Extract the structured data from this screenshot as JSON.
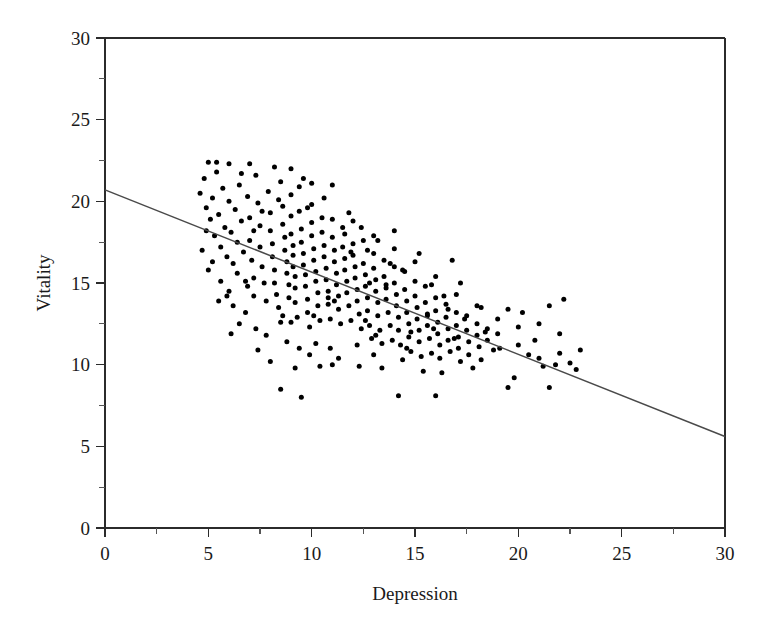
{
  "chart_data": {
    "type": "scatter",
    "title": "",
    "xlabel": "Depression",
    "ylabel": "Vitality",
    "xlim": [
      0,
      30
    ],
    "ylim": [
      0,
      30
    ],
    "xticks": [
      0,
      5,
      10,
      15,
      20,
      25,
      30
    ],
    "yticks": [
      0,
      5,
      10,
      15,
      20,
      25,
      30
    ],
    "xtick_labels": [
      "0",
      "5",
      "10",
      "15",
      "20",
      "25",
      "30"
    ],
    "ytick_labels": [
      "0",
      "5",
      "10",
      "15",
      "20",
      "25",
      "30"
    ],
    "minor_tick_step": 2.5,
    "grid": false,
    "legend": null,
    "marker": {
      "shape": "circle",
      "color": "#000000",
      "size_px": 5
    },
    "trendline": {
      "type": "linear",
      "color": "#4a4a4a",
      "x_start": 0,
      "y_start": 20.7,
      "x_end": 30,
      "y_end": 5.6,
      "slope": -0.503,
      "intercept": 20.7
    },
    "n_points": 330,
    "points": [
      [
        4.6,
        20.5
      ],
      [
        4.8,
        21.4
      ],
      [
        4.9,
        19.6
      ],
      [
        5.0,
        22.4
      ],
      [
        5.1,
        18.9
      ],
      [
        5.2,
        20.2
      ],
      [
        5.3,
        17.9
      ],
      [
        5.4,
        21.8
      ],
      [
        5.5,
        19.2
      ],
      [
        5.6,
        17.2
      ],
      [
        5.7,
        20.8
      ],
      [
        5.8,
        18.4
      ],
      [
        5.9,
        16.6
      ],
      [
        6.0,
        22.3
      ],
      [
        6.0,
        20.0
      ],
      [
        6.1,
        18.1
      ],
      [
        6.2,
        16.2
      ],
      [
        6.3,
        19.5
      ],
      [
        6.4,
        17.5
      ],
      [
        6.4,
        15.6
      ],
      [
        6.5,
        21.0
      ],
      [
        6.6,
        18.8
      ],
      [
        6.7,
        16.9
      ],
      [
        6.8,
        15.1
      ],
      [
        6.9,
        20.3
      ],
      [
        7.0,
        19.0
      ],
      [
        7.0,
        17.6
      ],
      [
        7.1,
        16.4
      ],
      [
        7.2,
        15.3
      ],
      [
        7.2,
        14.2
      ],
      [
        7.3,
        21.6
      ],
      [
        7.4,
        19.9
      ],
      [
        7.5,
        18.5
      ],
      [
        7.5,
        17.2
      ],
      [
        7.6,
        16.0
      ],
      [
        7.7,
        15.0
      ],
      [
        7.8,
        13.9
      ],
      [
        7.9,
        20.6
      ],
      [
        8.0,
        19.3
      ],
      [
        8.0,
        18.2
      ],
      [
        8.1,
        17.4
      ],
      [
        8.1,
        16.6
      ],
      [
        8.2,
        15.8
      ],
      [
        8.2,
        15.0
      ],
      [
        8.3,
        14.3
      ],
      [
        8.4,
        13.5
      ],
      [
        8.5,
        12.6
      ],
      [
        8.5,
        21.2
      ],
      [
        8.6,
        19.7
      ],
      [
        8.6,
        18.6
      ],
      [
        8.7,
        17.8
      ],
      [
        8.7,
        17.0
      ],
      [
        8.8,
        16.3
      ],
      [
        8.8,
        15.6
      ],
      [
        8.9,
        14.9
      ],
      [
        8.9,
        14.1
      ],
      [
        9.0,
        22.0
      ],
      [
        9.0,
        20.4
      ],
      [
        9.0,
        19.1
      ],
      [
        9.0,
        18.0
      ],
      [
        9.1,
        17.3
      ],
      [
        9.1,
        16.7
      ],
      [
        9.1,
        16.0
      ],
      [
        9.2,
        15.4
      ],
      [
        9.2,
        14.7
      ],
      [
        9.2,
        13.8
      ],
      [
        9.3,
        12.9
      ],
      [
        9.4,
        20.9
      ],
      [
        9.4,
        19.4
      ],
      [
        9.5,
        18.3
      ],
      [
        9.5,
        17.5
      ],
      [
        9.6,
        16.8
      ],
      [
        9.6,
        16.1
      ],
      [
        9.7,
        15.5
      ],
      [
        9.7,
        14.8
      ],
      [
        9.8,
        14.0
      ],
      [
        9.8,
        13.2
      ],
      [
        9.9,
        12.3
      ],
      [
        10.0,
        21.1
      ],
      [
        10.0,
        19.8
      ],
      [
        10.0,
        18.7
      ],
      [
        10.0,
        17.9
      ],
      [
        10.1,
        17.1
      ],
      [
        10.1,
        16.4
      ],
      [
        10.2,
        15.7
      ],
      [
        10.2,
        15.1
      ],
      [
        10.3,
        14.4
      ],
      [
        10.3,
        13.6
      ],
      [
        10.4,
        12.7
      ],
      [
        10.5,
        19.0
      ],
      [
        10.5,
        18.1
      ],
      [
        10.6,
        17.3
      ],
      [
        10.6,
        16.6
      ],
      [
        10.7,
        15.9
      ],
      [
        10.7,
        15.2
      ],
      [
        10.8,
        14.5
      ],
      [
        10.8,
        13.7
      ],
      [
        10.9,
        12.8
      ],
      [
        11.0,
        21.0
      ],
      [
        11.0,
        18.9
      ],
      [
        11.0,
        17.8
      ],
      [
        11.1,
        17.0
      ],
      [
        11.1,
        16.3
      ],
      [
        11.2,
        15.6
      ],
      [
        11.2,
        14.9
      ],
      [
        11.3,
        14.2
      ],
      [
        11.3,
        13.4
      ],
      [
        11.4,
        12.5
      ],
      [
        11.5,
        18.4
      ],
      [
        11.5,
        17.2
      ],
      [
        11.6,
        16.5
      ],
      [
        11.6,
        15.8
      ],
      [
        11.7,
        15.1
      ],
      [
        11.7,
        14.4
      ],
      [
        11.8,
        13.6
      ],
      [
        11.9,
        12.7
      ],
      [
        12.0,
        18.8
      ],
      [
        12.0,
        17.4
      ],
      [
        12.0,
        16.7
      ],
      [
        12.1,
        16.0
      ],
      [
        12.1,
        15.3
      ],
      [
        12.2,
        14.6
      ],
      [
        12.2,
        13.9
      ],
      [
        12.3,
        13.1
      ],
      [
        12.4,
        12.2
      ],
      [
        12.5,
        17.6
      ],
      [
        12.5,
        16.2
      ],
      [
        12.6,
        15.5
      ],
      [
        12.6,
        14.8
      ],
      [
        12.7,
        14.1
      ],
      [
        12.7,
        13.3
      ],
      [
        12.8,
        12.4
      ],
      [
        12.9,
        11.6
      ],
      [
        13.0,
        17.9
      ],
      [
        13.0,
        16.8
      ],
      [
        13.0,
        15.9
      ],
      [
        13.1,
        15.2
      ],
      [
        13.1,
        14.5
      ],
      [
        13.2,
        13.8
      ],
      [
        13.2,
        13.0
      ],
      [
        13.3,
        12.1
      ],
      [
        13.4,
        11.3
      ],
      [
        13.5,
        16.4
      ],
      [
        13.5,
        15.4
      ],
      [
        13.6,
        14.7
      ],
      [
        13.6,
        14.0
      ],
      [
        13.7,
        13.2
      ],
      [
        13.8,
        12.4
      ],
      [
        13.9,
        11.5
      ],
      [
        14.0,
        17.1
      ],
      [
        14.0,
        16.0
      ],
      [
        14.0,
        15.0
      ],
      [
        14.1,
        14.3
      ],
      [
        14.1,
        13.6
      ],
      [
        14.2,
        12.9
      ],
      [
        14.2,
        12.1
      ],
      [
        14.3,
        11.2
      ],
      [
        14.4,
        10.3
      ],
      [
        14.5,
        15.7
      ],
      [
        14.5,
        14.6
      ],
      [
        14.6,
        13.9
      ],
      [
        14.6,
        13.2
      ],
      [
        14.7,
        12.5
      ],
      [
        14.7,
        11.7
      ],
      [
        14.8,
        10.8
      ],
      [
        15.0,
        16.3
      ],
      [
        15.0,
        15.1
      ],
      [
        15.0,
        14.2
      ],
      [
        15.1,
        13.5
      ],
      [
        15.1,
        12.8
      ],
      [
        15.2,
        12.1
      ],
      [
        15.2,
        11.4
      ],
      [
        15.3,
        10.5
      ],
      [
        15.4,
        9.6
      ],
      [
        15.5,
        14.8
      ],
      [
        15.5,
        13.8
      ],
      [
        15.6,
        13.1
      ],
      [
        15.6,
        12.4
      ],
      [
        15.7,
        11.6
      ],
      [
        15.8,
        10.7
      ],
      [
        16.0,
        15.4
      ],
      [
        16.0,
        14.1
      ],
      [
        16.0,
        13.3
      ],
      [
        16.1,
        12.6
      ],
      [
        16.1,
        11.9
      ],
      [
        16.2,
        11.2
      ],
      [
        16.2,
        10.4
      ],
      [
        16.3,
        9.5
      ],
      [
        16.5,
        13.7
      ],
      [
        16.5,
        12.9
      ],
      [
        16.6,
        12.2
      ],
      [
        16.6,
        11.5
      ],
      [
        16.7,
        10.8
      ],
      [
        17.0,
        14.3
      ],
      [
        17.0,
        13.2
      ],
      [
        17.0,
        12.4
      ],
      [
        17.1,
        11.7
      ],
      [
        17.1,
        11.0
      ],
      [
        17.2,
        10.2
      ],
      [
        17.5,
        13.0
      ],
      [
        17.5,
        12.1
      ],
      [
        17.6,
        11.4
      ],
      [
        17.6,
        10.6
      ],
      [
        18.0,
        13.6
      ],
      [
        18.0,
        12.5
      ],
      [
        18.0,
        11.8
      ],
      [
        18.1,
        11.1
      ],
      [
        18.2,
        10.3
      ],
      [
        18.5,
        12.2
      ],
      [
        18.5,
        11.5
      ],
      [
        19.0,
        12.8
      ],
      [
        19.0,
        11.9
      ],
      [
        19.1,
        11.0
      ],
      [
        19.5,
        8.6
      ],
      [
        20.0,
        12.3
      ],
      [
        20.0,
        11.2
      ],
      [
        20.5,
        10.6
      ],
      [
        21.0,
        12.5
      ],
      [
        21.0,
        10.4
      ],
      [
        21.2,
        9.9
      ],
      [
        21.5,
        13.6
      ],
      [
        21.5,
        8.6
      ],
      [
        22.0,
        11.9
      ],
      [
        22.0,
        10.7
      ],
      [
        22.2,
        14.0
      ],
      [
        22.5,
        10.1
      ],
      [
        22.8,
        9.7
      ],
      [
        23.0,
        10.9
      ],
      [
        8.5,
        8.5
      ],
      [
        14.2,
        8.1
      ],
      [
        16.0,
        8.1
      ],
      [
        11.0,
        10.0
      ],
      [
        12.3,
        9.9
      ],
      [
        13.4,
        9.8
      ],
      [
        6.5,
        12.5
      ],
      [
        7.3,
        12.2
      ],
      [
        5.9,
        14.2
      ],
      [
        6.2,
        13.6
      ],
      [
        7.8,
        11.8
      ],
      [
        8.8,
        11.4
      ],
      [
        9.4,
        11.0
      ],
      [
        10.2,
        11.3
      ],
      [
        10.9,
        11.0
      ],
      [
        4.9,
        18.2
      ],
      [
        5.2,
        16.3
      ],
      [
        5.6,
        15.1
      ],
      [
        6.0,
        14.5
      ],
      [
        6.8,
        13.2
      ],
      [
        19.5,
        13.4
      ],
      [
        20.2,
        13.2
      ],
      [
        18.4,
        12.0
      ],
      [
        17.8,
        9.8
      ],
      [
        12.7,
        17.0
      ],
      [
        13.2,
        17.6
      ],
      [
        14.0,
        18.2
      ],
      [
        11.8,
        19.3
      ],
      [
        10.6,
        20.2
      ],
      [
        9.6,
        21.4
      ],
      [
        8.2,
        22.1
      ],
      [
        7.0,
        22.3
      ],
      [
        5.4,
        22.4
      ],
      [
        6.6,
        21.7
      ],
      [
        9.2,
        9.8
      ],
      [
        10.4,
        9.9
      ],
      [
        8.0,
        10.2
      ],
      [
        7.4,
        10.9
      ],
      [
        15.8,
        14.9
      ],
      [
        16.4,
        14.2
      ],
      [
        17.2,
        15.0
      ],
      [
        12.2,
        11.2
      ],
      [
        13.0,
        10.6
      ],
      [
        11.3,
        10.4
      ],
      [
        9.9,
        10.6
      ],
      [
        14.8,
        12.0
      ],
      [
        15.2,
        16.8
      ],
      [
        16.8,
        16.4
      ],
      [
        6.1,
        11.9
      ],
      [
        7.6,
        19.4
      ],
      [
        8.4,
        20.1
      ],
      [
        9.8,
        19.6
      ],
      [
        11.6,
        18.0
      ],
      [
        12.8,
        15.0
      ],
      [
        13.8,
        16.2
      ],
      [
        5.0,
        15.8
      ],
      [
        5.5,
        13.9
      ],
      [
        4.7,
        17.0
      ],
      [
        18.8,
        10.9
      ],
      [
        19.8,
        9.2
      ],
      [
        14.4,
        15.8
      ],
      [
        15.6,
        13.0
      ],
      [
        10.8,
        14.1
      ],
      [
        11.9,
        16.9
      ],
      [
        12.4,
        18.4
      ],
      [
        13.6,
        14.9
      ],
      [
        17.4,
        12.8
      ],
      [
        16.6,
        13.4
      ],
      [
        18.2,
        13.5
      ],
      [
        9.0,
        12.6
      ],
      [
        8.6,
        13.0
      ],
      [
        7.2,
        18.2
      ],
      [
        6.9,
        14.8
      ],
      [
        10.1,
        13.0
      ],
      [
        11.1,
        13.9
      ],
      [
        12.6,
        12.7
      ],
      [
        13.1,
        11.8
      ],
      [
        14.6,
        11.0
      ],
      [
        15.9,
        12.2
      ],
      [
        16.9,
        11.6
      ],
      [
        20.8,
        11.5
      ],
      [
        9.5,
        8.0
      ],
      [
        21.8,
        10.0
      ]
    ]
  },
  "axes": {
    "x_title": "Depression",
    "y_title": "Vitality"
  },
  "colors": {
    "point": "#000000",
    "trendline": "#4a4a4a",
    "axis": "#2b2b2b",
    "background": "#ffffff"
  }
}
